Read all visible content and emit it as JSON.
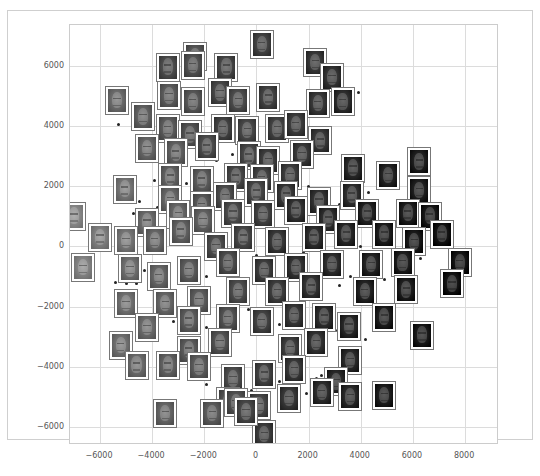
{
  "chart_data": {
    "type": "scatter",
    "title": "",
    "xlabel": "",
    "ylabel": "",
    "xlim": [
      -7150,
      9300
    ],
    "ylim": [
      -6600,
      7350
    ],
    "grid": true,
    "legend": null,
    "x_ticks": [
      -6000,
      -4000,
      -2000,
      0,
      2000,
      4000,
      6000,
      8000
    ],
    "y_ticks": [
      6000,
      4000,
      2000,
      0,
      -2000,
      -4000,
      -6000
    ],
    "x_tick_labels": [
      "−6000",
      "−4000",
      "−2000",
      "0",
      "2000",
      "4000",
      "6000",
      "8000"
    ],
    "y_tick_labels": [
      "6000",
      "4000",
      "2000",
      "0",
      "−2000",
      "−4000",
      "−6000"
    ],
    "thumbnail_points": [
      {
        "x": 200,
        "y": 6700,
        "tone": 90
      },
      {
        "x": -2350,
        "y": 6300,
        "tone": 110
      },
      {
        "x": -3400,
        "y": 5950,
        "tone": 100
      },
      {
        "x": -2450,
        "y": 6000,
        "tone": 105
      },
      {
        "x": -1150,
        "y": 5950,
        "tone": 95
      },
      {
        "x": 2250,
        "y": 6100,
        "tone": 80
      },
      {
        "x": 2900,
        "y": 5600,
        "tone": 75
      },
      {
        "x": -5350,
        "y": 4850,
        "tone": 130
      },
      {
        "x": -4350,
        "y": 4300,
        "tone": 120
      },
      {
        "x": -3350,
        "y": 5000,
        "tone": 115
      },
      {
        "x": -2450,
        "y": 4800,
        "tone": 110
      },
      {
        "x": -1400,
        "y": 5100,
        "tone": 95
      },
      {
        "x": -700,
        "y": 4850,
        "tone": 100
      },
      {
        "x": 450,
        "y": 4950,
        "tone": 90
      },
      {
        "x": 2350,
        "y": 4750,
        "tone": 80
      },
      {
        "x": 3300,
        "y": 4800,
        "tone": 70
      },
      {
        "x": -3400,
        "y": 3900,
        "tone": 115
      },
      {
        "x": -2550,
        "y": 3700,
        "tone": 105
      },
      {
        "x": -1300,
        "y": 3900,
        "tone": 90
      },
      {
        "x": -350,
        "y": 3850,
        "tone": 95
      },
      {
        "x": 800,
        "y": 3900,
        "tone": 90
      },
      {
        "x": 1500,
        "y": 4050,
        "tone": 85
      },
      {
        "x": 2450,
        "y": 3500,
        "tone": 80
      },
      {
        "x": -4200,
        "y": 3250,
        "tone": 125
      },
      {
        "x": -3100,
        "y": 3100,
        "tone": 120
      },
      {
        "x": -1900,
        "y": 3300,
        "tone": 100
      },
      {
        "x": -300,
        "y": 3000,
        "tone": 95
      },
      {
        "x": 450,
        "y": 2850,
        "tone": 85
      },
      {
        "x": 1750,
        "y": 3050,
        "tone": 80
      },
      {
        "x": -3300,
        "y": 2300,
        "tone": 120
      },
      {
        "x": -2100,
        "y": 2200,
        "tone": 115
      },
      {
        "x": -800,
        "y": 2300,
        "tone": 95
      },
      {
        "x": 200,
        "y": 2250,
        "tone": 90
      },
      {
        "x": 1300,
        "y": 2350,
        "tone": 85
      },
      {
        "x": 3700,
        "y": 2600,
        "tone": 65
      },
      {
        "x": 5050,
        "y": 2350,
        "tone": 60
      },
      {
        "x": 6250,
        "y": 2800,
        "tone": 55
      },
      {
        "x": -5050,
        "y": 1900,
        "tone": 140
      },
      {
        "x": -3300,
        "y": 1550,
        "tone": 125
      },
      {
        "x": -2100,
        "y": 1350,
        "tone": 110
      },
      {
        "x": -1200,
        "y": 1650,
        "tone": 100
      },
      {
        "x": 0,
        "y": 1800,
        "tone": 95
      },
      {
        "x": 1150,
        "y": 1700,
        "tone": 80
      },
      {
        "x": 2400,
        "y": 1500,
        "tone": 75
      },
      {
        "x": 3650,
        "y": 1700,
        "tone": 70
      },
      {
        "x": 6250,
        "y": 1850,
        "tone": 55
      },
      {
        "x": -7000,
        "y": 1000,
        "tone": 160
      },
      {
        "x": -4200,
        "y": 800,
        "tone": 130
      },
      {
        "x": -3000,
        "y": 1050,
        "tone": 125
      },
      {
        "x": -2050,
        "y": 850,
        "tone": 120
      },
      {
        "x": -900,
        "y": 1100,
        "tone": 100
      },
      {
        "x": 250,
        "y": 1050,
        "tone": 90
      },
      {
        "x": 1500,
        "y": 1200,
        "tone": 75
      },
      {
        "x": 2750,
        "y": 900,
        "tone": 70
      },
      {
        "x": 4250,
        "y": 1100,
        "tone": 60
      },
      {
        "x": 5800,
        "y": 1100,
        "tone": 55
      },
      {
        "x": 6650,
        "y": 1000,
        "tone": 50
      },
      {
        "x": -6000,
        "y": 300,
        "tone": 150
      },
      {
        "x": -5000,
        "y": 200,
        "tone": 140
      },
      {
        "x": -3900,
        "y": 200,
        "tone": 125
      },
      {
        "x": -2900,
        "y": 500,
        "tone": 120
      },
      {
        "x": -1550,
        "y": 0,
        "tone": 100
      },
      {
        "x": -500,
        "y": 300,
        "tone": 95
      },
      {
        "x": 800,
        "y": 150,
        "tone": 80
      },
      {
        "x": 2200,
        "y": 300,
        "tone": 70
      },
      {
        "x": 3450,
        "y": 400,
        "tone": 65
      },
      {
        "x": 4900,
        "y": 400,
        "tone": 55
      },
      {
        "x": 6050,
        "y": 150,
        "tone": 50
      },
      {
        "x": 7100,
        "y": 400,
        "tone": 45
      },
      {
        "x": -6650,
        "y": -700,
        "tone": 155
      },
      {
        "x": -4850,
        "y": -750,
        "tone": 135
      },
      {
        "x": -3750,
        "y": -1000,
        "tone": 125
      },
      {
        "x": -2600,
        "y": -800,
        "tone": 115
      },
      {
        "x": -1100,
        "y": -550,
        "tone": 100
      },
      {
        "x": 300,
        "y": -800,
        "tone": 85
      },
      {
        "x": 1500,
        "y": -700,
        "tone": 75
      },
      {
        "x": 2900,
        "y": -600,
        "tone": 70
      },
      {
        "x": 4400,
        "y": -600,
        "tone": 60
      },
      {
        "x": 5600,
        "y": -550,
        "tone": 55
      },
      {
        "x": 7800,
        "y": -550,
        "tone": 45
      },
      {
        "x": -5000,
        "y": -1900,
        "tone": 135
      },
      {
        "x": -3500,
        "y": -1900,
        "tone": 125
      },
      {
        "x": -2200,
        "y": -1800,
        "tone": 115
      },
      {
        "x": -700,
        "y": -1500,
        "tone": 100
      },
      {
        "x": 800,
        "y": -1500,
        "tone": 85
      },
      {
        "x": 2100,
        "y": -1350,
        "tone": 75
      },
      {
        "x": 4150,
        "y": -1500,
        "tone": 60
      },
      {
        "x": 5750,
        "y": -1450,
        "tone": 55
      },
      {
        "x": 7500,
        "y": -1250,
        "tone": 45
      },
      {
        "x": -4200,
        "y": -2700,
        "tone": 130
      },
      {
        "x": -2600,
        "y": -2450,
        "tone": 115
      },
      {
        "x": -1100,
        "y": -2400,
        "tone": 105
      },
      {
        "x": 200,
        "y": -2500,
        "tone": 90
      },
      {
        "x": 1450,
        "y": -2300,
        "tone": 80
      },
      {
        "x": 2600,
        "y": -2350,
        "tone": 70
      },
      {
        "x": 3550,
        "y": -2650,
        "tone": 65
      },
      {
        "x": 4900,
        "y": -2350,
        "tone": 55
      },
      {
        "x": -5200,
        "y": -3300,
        "tone": 135
      },
      {
        "x": -2600,
        "y": -3450,
        "tone": 115
      },
      {
        "x": -1400,
        "y": -3200,
        "tone": 105
      },
      {
        "x": 1300,
        "y": -3400,
        "tone": 85
      },
      {
        "x": 2300,
        "y": -3200,
        "tone": 75
      },
      {
        "x": 3600,
        "y": -3800,
        "tone": 65
      },
      {
        "x": 6350,
        "y": -2950,
        "tone": 50
      },
      {
        "x": -4600,
        "y": -3950,
        "tone": 130
      },
      {
        "x": -3400,
        "y": -3950,
        "tone": 120
      },
      {
        "x": -2200,
        "y": -4000,
        "tone": 115
      },
      {
        "x": -900,
        "y": -4400,
        "tone": 100
      },
      {
        "x": 300,
        "y": -4250,
        "tone": 90
      },
      {
        "x": 1450,
        "y": -4100,
        "tone": 80
      },
      {
        "x": 3050,
        "y": -4500,
        "tone": 65
      },
      {
        "x": -1100,
        "y": -5150,
        "tone": 105
      },
      {
        "x": 1250,
        "y": -5050,
        "tone": 80
      },
      {
        "x": 2500,
        "y": -4850,
        "tone": 70
      },
      {
        "x": 3600,
        "y": -5000,
        "tone": 65
      },
      {
        "x": 4900,
        "y": -4950,
        "tone": 55
      },
      {
        "x": -3500,
        "y": -5550,
        "tone": 125
      },
      {
        "x": -1700,
        "y": -5550,
        "tone": 115
      },
      {
        "x": -800,
        "y": -5200,
        "tone": 105
      },
      {
        "x": 100,
        "y": -5300,
        "tone": 95
      },
      {
        "x": 300,
        "y": -6250,
        "tone": 85
      },
      {
        "x": -400,
        "y": -5500,
        "tone": 95
      }
    ],
    "dot_points": [
      {
        "x": -5300,
        "y": 4050
      },
      {
        "x": -3800,
        "y": 4100
      },
      {
        "x": 3900,
        "y": 5100
      },
      {
        "x": -3200,
        "y": 3450
      },
      {
        "x": -1550,
        "y": 2850
      },
      {
        "x": -900,
        "y": 3050
      },
      {
        "x": -3900,
        "y": 2200
      },
      {
        "x": -2700,
        "y": 2100
      },
      {
        "x": -2100,
        "y": 1900
      },
      {
        "x": -4500,
        "y": 1500
      },
      {
        "x": -4700,
        "y": 1100
      },
      {
        "x": -3800,
        "y": 1300
      },
      {
        "x": -1700,
        "y": 1200
      },
      {
        "x": -600,
        "y": 1500
      },
      {
        "x": 600,
        "y": 1400
      },
      {
        "x": 900,
        "y": 600
      },
      {
        "x": 1100,
        "y": 2000
      },
      {
        "x": 2000,
        "y": 2000
      },
      {
        "x": 2600,
        "y": 1600
      },
      {
        "x": 3200,
        "y": 1400
      },
      {
        "x": 3300,
        "y": 2100
      },
      {
        "x": 4300,
        "y": 1800
      },
      {
        "x": 5500,
        "y": 1300
      },
      {
        "x": 6800,
        "y": 500
      },
      {
        "x": 4000,
        "y": 0
      },
      {
        "x": 5200,
        "y": -100
      },
      {
        "x": 6300,
        "y": -400
      },
      {
        "x": -5400,
        "y": -1200
      },
      {
        "x": -5000,
        "y": -1250
      },
      {
        "x": -4600,
        "y": -1250
      },
      {
        "x": -4300,
        "y": -800
      },
      {
        "x": -2900,
        "y": -400
      },
      {
        "x": -1900,
        "y": -1000
      },
      {
        "x": -500,
        "y": -1100
      },
      {
        "x": 0,
        "y": -300
      },
      {
        "x": 500,
        "y": 0
      },
      {
        "x": 1000,
        "y": -1100
      },
      {
        "x": 1800,
        "y": -200
      },
      {
        "x": 2400,
        "y": -1000
      },
      {
        "x": 3200,
        "y": -1300
      },
      {
        "x": 3600,
        "y": -1000
      },
      {
        "x": 4900,
        "y": -1100
      },
      {
        "x": -4500,
        "y": -2300
      },
      {
        "x": -3200,
        "y": -2500
      },
      {
        "x": -1900,
        "y": -2700
      },
      {
        "x": -300,
        "y": -2100
      },
      {
        "x": 900,
        "y": -2600
      },
      {
        "x": 1900,
        "y": -2900
      },
      {
        "x": 3100,
        "y": -2800
      },
      {
        "x": 4200,
        "y": -3100
      },
      {
        "x": -3600,
        "y": -4400
      },
      {
        "x": -1900,
        "y": -4600
      },
      {
        "x": -200,
        "y": -4800
      },
      {
        "x": 900,
        "y": -4500
      },
      {
        "x": 2300,
        "y": -4400
      },
      {
        "x": 2500,
        "y": -4300
      },
      {
        "x": -3800,
        "y": -5200
      },
      {
        "x": -1400,
        "y": -5400
      },
      {
        "x": 1900,
        "y": -4900
      },
      {
        "x": 3000,
        "y": -4200
      }
    ]
  }
}
